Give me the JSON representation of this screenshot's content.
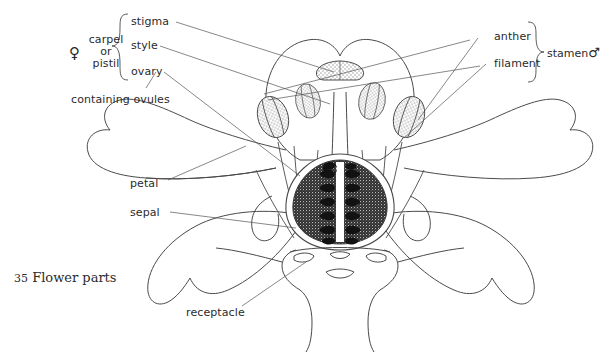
{
  "figure": {
    "caption_number": "35",
    "caption_title": "Flower parts"
  },
  "groups": {
    "female": {
      "symbol": "♀",
      "name_line1": "carpel",
      "name_line2": "or",
      "name_line3": "pistil",
      "bracket": "left-brace"
    },
    "male": {
      "label": "stamen",
      "symbol": "♂",
      "bracket": "right-brace"
    }
  },
  "labels": {
    "stigma": "stigma",
    "style": "style",
    "ovary": "ovary",
    "containing_ovules": "containing ovules",
    "petal": "petal",
    "sepal": "sepal",
    "receptacle": "receptacle",
    "anther": "anther",
    "filament": "filament"
  },
  "colors": {
    "ink": "#2b2b2b",
    "line": "#4a4a4a",
    "background": "#ffffff",
    "anther_fill": "#d9d9d9",
    "ovary_fill": "#3a3a3a",
    "ovule_fill": "#ffffff"
  },
  "structure": {
    "anther_count": 4,
    "ovule_rows": 7,
    "ovule_columns": 2
  }
}
